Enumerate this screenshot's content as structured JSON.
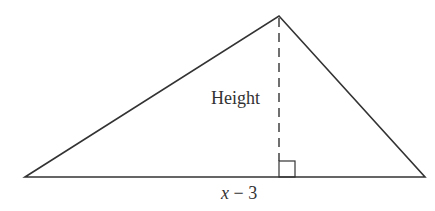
{
  "diagram": {
    "type": "triangle",
    "vertices": {
      "left": [
        25,
        177
      ],
      "apex": [
        279,
        16
      ],
      "right": [
        425,
        177
      ]
    },
    "height_line": {
      "style": "dashed",
      "from": [
        279,
        16
      ],
      "to": [
        279,
        177
      ]
    },
    "right_angle_marker": {
      "x": 279,
      "y": 161,
      "size": 16
    },
    "labels": {
      "height": "Height",
      "base_var": "x",
      "base_rest": " − 3"
    },
    "colors": {
      "stroke": "#333333",
      "background": "#ffffff"
    }
  }
}
